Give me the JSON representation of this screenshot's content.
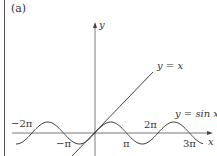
{
  "figure": {
    "panel_label": "(a)",
    "y_axis_label": "y",
    "x_axis_label": "x",
    "line_label": "y = x",
    "curve_label": "y = sin x",
    "ticks": {
      "neg_two_pi": "−2π",
      "neg_pi": "−π",
      "pi": "π",
      "two_pi": "2π",
      "three_pi": "3π"
    }
  },
  "chart_data": {
    "type": "line",
    "title": "(a)",
    "xlabel": "x",
    "ylabel": "y",
    "series": [
      {
        "name": "y = x",
        "function": "x"
      },
      {
        "name": "y = sin x",
        "function": "sin(x)"
      }
    ],
    "x_tick_labels": [
      "−2π",
      "−π",
      "π",
      "2π",
      "3π"
    ],
    "xlim": [
      "−2.6π",
      "3.6π"
    ],
    "grid": false,
    "annotations": [
      "y = x",
      "y = sin x"
    ]
  }
}
